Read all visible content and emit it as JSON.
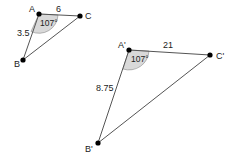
{
  "diagram": {
    "triangle1": {
      "vertices": {
        "A": "A",
        "B": "B",
        "C": "C"
      },
      "side_AC": "6",
      "side_AB": "3.5",
      "angle_A": "107°"
    },
    "triangle2": {
      "vertices": {
        "A": "A'",
        "B": "B'",
        "C": "C'"
      },
      "side_AC": "21",
      "side_AB": "8.75",
      "angle_A": "107°"
    },
    "colors": {
      "line": "#555555",
      "point": "#000000",
      "angle_fill": "#d9d9d9"
    }
  }
}
